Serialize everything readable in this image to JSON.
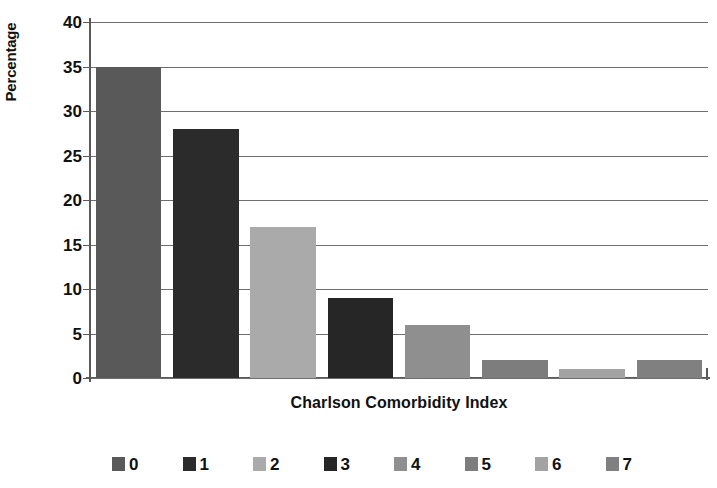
{
  "chart_data": {
    "type": "bar",
    "title": "",
    "subtitle": "",
    "xlabel": "Charlson Comorbidity Index",
    "ylabel": "Percentage",
    "categories": [
      "0",
      "1",
      "2",
      "3",
      "4",
      "5",
      "6",
      "7"
    ],
    "values": [
      35,
      28,
      17,
      9,
      6,
      2,
      1,
      2
    ],
    "ylim": [
      0,
      40
    ],
    "ytick_labels": [
      "0",
      "5",
      "10",
      "15",
      "20",
      "25",
      "30",
      "35",
      "40"
    ],
    "ytick_values": [
      0,
      5,
      10,
      15,
      20,
      25,
      30,
      35,
      40
    ],
    "grid": true,
    "grid_axis": "y",
    "legend_position": "bottom",
    "legend_entries": [
      {
        "label": "0",
        "color": "#595959"
      },
      {
        "label": "1",
        "color": "#2b2b2b"
      },
      {
        "label": "2",
        "color": "#aaaaaa"
      },
      {
        "label": "3",
        "color": "#262626"
      },
      {
        "label": "4",
        "color": "#8f8f8f"
      },
      {
        "label": "5",
        "color": "#7d7d7d"
      },
      {
        "label": "6",
        "color": "#a3a3a3"
      },
      {
        "label": "7",
        "color": "#808080"
      }
    ],
    "bar_colors": [
      "#595959",
      "#2b2b2b",
      "#aaaaaa",
      "#262626",
      "#8f8f8f",
      "#7d7d7d",
      "#a3a3a3",
      "#808080"
    ],
    "axis_color": "#5a5a5a",
    "grid_color": "#6e6e6e",
    "background": "#ffffff"
  },
  "axes": {
    "y_title": "Percentage",
    "x_title": "Charlson Comorbidity Index"
  }
}
